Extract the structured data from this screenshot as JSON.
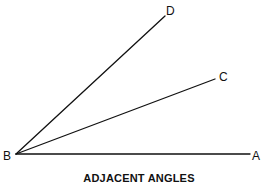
{
  "diagram": {
    "title": "ADJACENT ANGLES",
    "vertex": {
      "label": "B",
      "x": 16,
      "y": 154,
      "label_x": 3,
      "label_y": 160
    },
    "rays": [
      {
        "name": "ray-ba",
        "end_label": "A",
        "x2": 250,
        "y2": 154,
        "label_x": 252,
        "label_y": 160
      },
      {
        "name": "ray-bc",
        "end_label": "C",
        "x2": 215,
        "y2": 79,
        "label_x": 219,
        "label_y": 81
      },
      {
        "name": "ray-bd",
        "end_label": "D",
        "x2": 165,
        "y2": 16,
        "label_x": 166,
        "label_y": 15
      }
    ],
    "colors": {
      "line": "#111111",
      "text": "#111111",
      "background": "#ffffff"
    }
  }
}
